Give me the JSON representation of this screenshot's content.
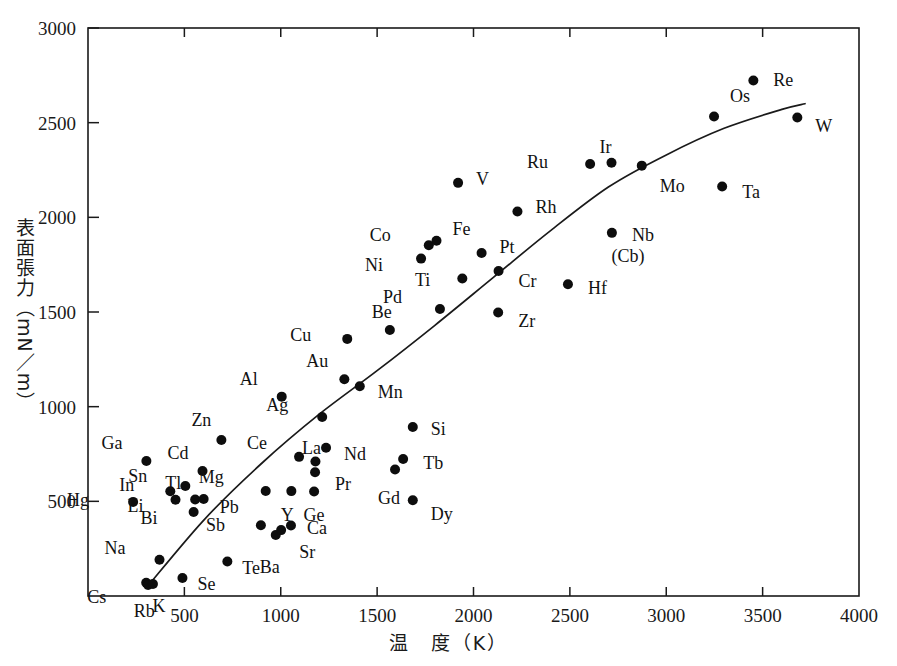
{
  "chart_data": {
    "type": "scatter",
    "title": "",
    "xlabel": "温　度（K）",
    "ylabel": "表面張力（mN／m）",
    "xlabel_meaning": "Temperature (K)",
    "ylabel_meaning": "Surface tension (mN/m)",
    "xlim": [
      0,
      4000
    ],
    "ylim": [
      0,
      3000
    ],
    "xticks": [
      0,
      500,
      1000,
      1500,
      2000,
      2500,
      3000,
      3500,
      4000
    ],
    "xticklabels": [
      "",
      "500",
      "1000",
      "1500",
      "2000",
      "2500",
      "3000",
      "3500",
      "4000"
    ],
    "yticks": [
      0,
      500,
      1000,
      1500,
      2000,
      2500,
      3000
    ],
    "yticklabels": [
      "",
      "500",
      "1000",
      "1500",
      "2000",
      "2500",
      "3000"
    ],
    "grid": false,
    "legend": false,
    "marker": "filled-circle",
    "marker_color": "#0d0d0d",
    "line_color": "#1a1a1a",
    "points": [
      {
        "label": "Cs",
        "x": 302,
        "y": 70,
        "lx": -40,
        "ly": 14
      },
      {
        "label": "Rb",
        "x": 312,
        "y": 58,
        "lx": -4,
        "ly": 26
      },
      {
        "label": "K",
        "x": 337,
        "y": 63,
        "lx": 6,
        "ly": 22
      },
      {
        "label": "Na",
        "x": 371,
        "y": 191,
        "lx": -34,
        "ly": -12
      },
      {
        "label": "Se",
        "x": 490,
        "y": 95,
        "lx": 15,
        "ly": 6
      },
      {
        "label": "Te",
        "x": 723,
        "y": 182,
        "lx": 15,
        "ly": 6
      },
      {
        "label": "Hg",
        "x": 234,
        "y": 497,
        "lx": -44,
        "ly": -2
      },
      {
        "label": "Li",
        "x": 454,
        "y": 508,
        "lx": -32,
        "ly": 6
      },
      {
        "label": "In",
        "x": 427,
        "y": 553,
        "lx": -36,
        "ly": -6
      },
      {
        "label": "Ga",
        "x": 303,
        "y": 713,
        "lx": -24,
        "ly": -18
      },
      {
        "label": "Sn",
        "x": 505,
        "y": 581,
        "lx": -38,
        "ly": -10
      },
      {
        "label": "Tl",
        "x": 556,
        "y": 510,
        "lx": -14,
        "ly": -16
      },
      {
        "label": "Pb",
        "x": 600,
        "y": 512,
        "lx": 16,
        "ly": 8
      },
      {
        "label": "Cd",
        "x": 594,
        "y": 660,
        "lx": -14,
        "ly": -18
      },
      {
        "label": "Zn",
        "x": 692,
        "y": 824,
        "lx": -10,
        "ly": -20
      },
      {
        "label": "Bi",
        "x": 548,
        "y": 444,
        "lx": -36,
        "ly": 6
      },
      {
        "label": "Mg",
        "x": 922,
        "y": 555,
        "lx": -42,
        "ly": -14
      },
      {
        "label": "Sb",
        "x": 897,
        "y": 374,
        "lx": -36,
        "ly": 0
      },
      {
        "label": "Ba",
        "x": 974,
        "y": 322,
        "lx": -6,
        "ly": 32
      },
      {
        "label": "Sr",
        "x": 1002,
        "y": 348,
        "lx": 18,
        "ly": 22
      },
      {
        "label": "Ca",
        "x": 1053,
        "y": 372,
        "lx": 16,
        "ly": 2
      },
      {
        "label": "Y",
        "x": 1055,
        "y": 554,
        "lx": -4,
        "ly": 24
      },
      {
        "label": "Ce",
        "x": 1095,
        "y": 735,
        "lx": -32,
        "ly": -14
      },
      {
        "label": "Ge",
        "x": 1173,
        "y": 552,
        "lx": 0,
        "ly": 24
      },
      {
        "label": "Pr",
        "x": 1178,
        "y": 654,
        "lx": 20,
        "ly": 12
      },
      {
        "label": "La",
        "x": 1180,
        "y": 710,
        "lx": -4,
        "ly": -14
      },
      {
        "label": "Nd",
        "x": 1235,
        "y": 783,
        "lx": 18,
        "ly": 6
      },
      {
        "label": "Ag",
        "x": 1215,
        "y": 945,
        "lx": -34,
        "ly": -12
      },
      {
        "label": "Au",
        "x": 1330,
        "y": 1145,
        "lx": -16,
        "ly": -18
      },
      {
        "label": "Cu",
        "x": 1345,
        "y": 1358,
        "lx": -36,
        "ly": -4
      },
      {
        "label": "Al",
        "x": 1005,
        "y": 1053,
        "lx": -24,
        "ly": -18
      },
      {
        "label": "Be",
        "x": 1566,
        "y": 1405,
        "lx": -8,
        "ly": -18
      },
      {
        "label": "Mn",
        "x": 1410,
        "y": 1108,
        "lx": 18,
        "ly": 6
      },
      {
        "label": "Si",
        "x": 1685,
        "y": 893,
        "lx": 18,
        "ly": 2
      },
      {
        "label": "Gd",
        "x": 1593,
        "y": 668,
        "lx": -6,
        "ly": 28
      },
      {
        "label": "Tb",
        "x": 1635,
        "y": 724,
        "lx": 20,
        "ly": 4
      },
      {
        "label": "Dy",
        "x": 1685,
        "y": 506,
        "lx": 18,
        "ly": 14
      },
      {
        "label": "Pd",
        "x": 1826,
        "y": 1516,
        "lx": -38,
        "ly": -12
      },
      {
        "label": "Ni",
        "x": 1728,
        "y": 1782,
        "lx": -38,
        "ly": 6
      },
      {
        "label": "Co",
        "x": 1768,
        "y": 1853,
        "lx": -38,
        "ly": -10
      },
      {
        "label": "Fe",
        "x": 1808,
        "y": 1876,
        "lx": 16,
        "ly": -12
      },
      {
        "label": "Ti",
        "x": 1942,
        "y": 1677,
        "lx": -32,
        "ly": 2
      },
      {
        "label": "V",
        "x": 1920,
        "y": 2182,
        "lx": 18,
        "ly": -4
      },
      {
        "label": "Pt",
        "x": 2042,
        "y": 1812,
        "lx": 18,
        "ly": -6
      },
      {
        "label": "Cr",
        "x": 2130,
        "y": 1717,
        "lx": 20,
        "ly": 10
      },
      {
        "label": "Zr",
        "x": 2128,
        "y": 1497,
        "lx": 20,
        "ly": 8
      },
      {
        "label": "Rh",
        "x": 2228,
        "y": 2031,
        "lx": 18,
        "ly": -4
      },
      {
        "label": "Hf",
        "x": 2490,
        "y": 1647,
        "lx": 20,
        "ly": 4
      },
      {
        "label": "Ru",
        "x": 2605,
        "y": 2282,
        "lx": -42,
        "ly": -2
      },
      {
        "label": "Ir",
        "x": 2716,
        "y": 2288,
        "lx": -6,
        "ly": -16
      },
      {
        "label": "Nb",
        "x": 2718,
        "y": 1918,
        "lx": 20,
        "ly": 2
      },
      {
        "label": "(Cb)",
        "x": null,
        "y": null,
        "lx": 0,
        "ly": 0,
        "text_only": true,
        "tx": 2716,
        "ty": 1766
      },
      {
        "label": "Mo",
        "x": 2873,
        "y": 2273,
        "lx": 18,
        "ly": 20
      },
      {
        "label": "Ta",
        "x": 3290,
        "y": 2163,
        "lx": 20,
        "ly": 6
      },
      {
        "label": "Re",
        "x": 3452,
        "y": 2723,
        "lx": 20,
        "ly": 0
      },
      {
        "label": "Os",
        "x": 3248,
        "y": 2533,
        "lx": 16,
        "ly": -20
      },
      {
        "label": "W",
        "x": 3680,
        "y": 2527,
        "lx": 18,
        "ly": 8
      }
    ],
    "trend_line": {
      "description": "hand-drawn monotonic increasing curve, steep and near-linear from origin to ~2200 K, flattening toward 3700 K",
      "points": [
        [
          300,
          40
        ],
        [
          600,
          400
        ],
        [
          900,
          700
        ],
        [
          1200,
          960
        ],
        [
          1500,
          1190
        ],
        [
          1800,
          1430
        ],
        [
          2100,
          1680
        ],
        [
          2400,
          1930
        ],
        [
          2700,
          2160
        ],
        [
          3000,
          2330
        ],
        [
          3300,
          2470
        ],
        [
          3600,
          2570
        ],
        [
          3720,
          2600
        ]
      ]
    }
  }
}
